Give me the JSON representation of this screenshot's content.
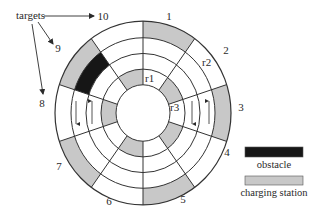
{
  "diagram": {
    "center": [
      143,
      113
    ],
    "y_scale": 1.045,
    "ring_radii": [
      27,
      42,
      57,
      72,
      88
    ],
    "sector_count": 10,
    "colors": {
      "line": "#333333",
      "background": "#ffffff",
      "charging_station": "#c8c8c8",
      "obstacle": "#161616",
      "text": "#2a2a2a"
    },
    "rings": [
      {
        "index": 1,
        "inner": 27,
        "outer": 42,
        "note": "innermost ring"
      },
      {
        "index": 2,
        "inner": 42,
        "outer": 57
      },
      {
        "index": 3,
        "inner": 57,
        "outer": 72
      },
      {
        "index": 4,
        "inner": 72,
        "outer": 88,
        "note": "outermost ring"
      }
    ],
    "filled_cells": [
      {
        "ring": 4,
        "sector": 1,
        "type": "charging_station"
      },
      {
        "ring": 4,
        "sector": 3,
        "type": "charging_station"
      },
      {
        "ring": 4,
        "sector": 5,
        "type": "charging_station"
      },
      {
        "ring": 4,
        "sector": 7,
        "type": "charging_station"
      },
      {
        "ring": 4,
        "sector": 9,
        "type": "charging_station"
      },
      {
        "ring": 3,
        "sector": 9,
        "type": "obstacle"
      },
      {
        "ring": 1,
        "sector": 2,
        "type": "charging_station"
      },
      {
        "ring": 1,
        "sector": 4,
        "type": "charging_station"
      },
      {
        "ring": 1,
        "sector": 6,
        "type": "charging_station"
      },
      {
        "ring": 1,
        "sector": 8,
        "type": "charging_station"
      },
      {
        "ring": 1,
        "sector": 10,
        "type": "charging_station"
      }
    ],
    "sector_labels": [
      {
        "text": "1",
        "x": 169,
        "y": 20
      },
      {
        "text": "2",
        "x": 226,
        "y": 54
      },
      {
        "text": "3",
        "x": 241,
        "y": 111
      },
      {
        "text": "4",
        "x": 227,
        "y": 156
      },
      {
        "text": "5",
        "x": 183,
        "y": 203
      },
      {
        "text": "6",
        "x": 109,
        "y": 205
      },
      {
        "text": "7",
        "x": 59,
        "y": 170
      },
      {
        "text": "8",
        "x": 42,
        "y": 107
      },
      {
        "text": "9",
        "x": 58,
        "y": 52
      },
      {
        "text": "10",
        "x": 103,
        "y": 20
      }
    ],
    "robot_labels": [
      {
        "text": "r1",
        "x": 145,
        "y": 82
      },
      {
        "text": "r2",
        "x": 202,
        "y": 66
      },
      {
        "text": "r3",
        "x": 170,
        "y": 111
      }
    ],
    "direction_arrows": [
      {
        "x": 76,
        "y1": 101,
        "y2": 124,
        "direction": "down"
      },
      {
        "x": 92,
        "y1": 124,
        "y2": 101,
        "direction": "up"
      },
      {
        "x": 192,
        "y1": 101,
        "y2": 124,
        "direction": "down"
      },
      {
        "x": 209,
        "y1": 124,
        "y2": 101,
        "direction": "up"
      }
    ],
    "targets_annotation": {
      "text": "targets",
      "x": 16,
      "y": 19,
      "arrows": [
        {
          "to": "10",
          "x1": 44,
          "y1": 16,
          "x2": 94,
          "y2": 16
        },
        {
          "to": "9",
          "x1": 38,
          "y1": 22,
          "x2": 53,
          "y2": 44
        },
        {
          "to": "8",
          "x1": 32,
          "y1": 24,
          "x2": 43,
          "y2": 94
        }
      ]
    }
  },
  "legend": {
    "items": [
      {
        "label": "obstacle",
        "swatch_color": "#161616",
        "box": [
          245,
          147,
          58,
          10
        ],
        "label_x": 274,
        "label_y": 168
      },
      {
        "label": "charging station",
        "swatch_color": "#c8c8c8",
        "box": [
          245,
          176,
          58,
          9
        ],
        "label_x": 274,
        "label_y": 196
      }
    ]
  }
}
